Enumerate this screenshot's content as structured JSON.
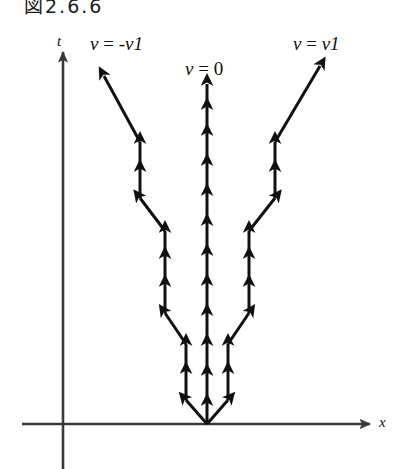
{
  "figure": {
    "caption": "図2.6.6",
    "background_color": "#ffffff",
    "ink_color": "#111111",
    "axis_color": "#3a3a3a",
    "width": 402,
    "height": 469
  },
  "axes": {
    "vertical": {
      "label": "t",
      "name": "time-axis",
      "arrow": "up"
    },
    "horizontal": {
      "label": "x",
      "name": "position-axis",
      "arrow": "right"
    },
    "origin": {
      "x": 207,
      "y": 424
    }
  },
  "worldlines": [
    {
      "id": "left",
      "label": "v = -v1",
      "label_parts": {
        "symbol": "v",
        "equals": " = ",
        "value": "-v1"
      },
      "description": "left zigzag worldline with upward arrowheads",
      "arrowhead_count": 11
    },
    {
      "id": "center",
      "label": "v = 0",
      "label_parts": {
        "symbol": "v",
        "equals": " = ",
        "value": "0"
      },
      "description": "vertical worldline with upward arrowheads",
      "arrowhead_count": 12
    },
    {
      "id": "right",
      "label": "v = v1",
      "label_parts": {
        "symbol": "v",
        "equals": " = ",
        "value": "v1"
      },
      "description": "right zigzag worldline with upward arrowheads",
      "arrowhead_count": 11
    }
  ]
}
